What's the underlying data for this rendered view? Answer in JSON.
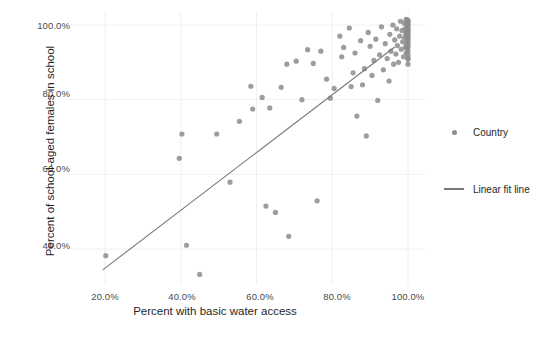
{
  "chart_data": {
    "type": "scatter",
    "title": "",
    "xlabel": "Percent with basic water access",
    "ylabel": "Percent of school-aged females in school",
    "xlim": [
      15.0,
      104.0
    ],
    "ylim": [
      30.0,
      104.0
    ],
    "xticks": [
      "20.0%",
      "40.0%",
      "60.0%",
      "80.0%",
      "100.0%"
    ],
    "xtick_values": [
      20,
      40,
      60,
      80,
      100
    ],
    "yticks": [
      "40.0%",
      "60.0%",
      "80.0%",
      "100.0%"
    ],
    "ytick_values": [
      40,
      60,
      80,
      100
    ],
    "grid": true,
    "legend_position": "right",
    "series": [
      {
        "name": "Country",
        "type": "scatter",
        "color": "#8c8c8c",
        "marker": "circle",
        "points": [
          [
            20.2,
            38.2
          ],
          [
            39.6,
            64.3
          ],
          [
            40.3,
            70.8
          ],
          [
            41.5,
            41.0
          ],
          [
            45.0,
            33.2
          ],
          [
            49.5,
            70.8
          ],
          [
            53.0,
            57.9
          ],
          [
            55.5,
            74.2
          ],
          [
            58.5,
            83.6
          ],
          [
            59.0,
            77.5
          ],
          [
            61.5,
            80.6
          ],
          [
            62.5,
            51.5
          ],
          [
            63.5,
            77.8
          ],
          [
            65.0,
            49.8
          ],
          [
            66.5,
            83.3
          ],
          [
            68.0,
            89.5
          ],
          [
            68.5,
            43.4
          ],
          [
            70.5,
            90.3
          ],
          [
            72.0,
            80.0
          ],
          [
            73.5,
            93.4
          ],
          [
            75.0,
            89.7
          ],
          [
            76.0,
            52.9
          ],
          [
            77.0,
            93.0
          ],
          [
            78.5,
            85.5
          ],
          [
            79.5,
            80.4
          ],
          [
            80.5,
            83.0
          ],
          [
            82.0,
            97.0
          ],
          [
            82.5,
            91.5
          ],
          [
            83.0,
            94.0
          ],
          [
            84.5,
            99.2
          ],
          [
            85.0,
            83.5
          ],
          [
            85.5,
            87.2
          ],
          [
            86.0,
            92.5
          ],
          [
            86.5,
            75.6
          ],
          [
            87.5,
            95.8
          ],
          [
            88.0,
            84.0
          ],
          [
            88.5,
            88.3
          ],
          [
            89.0,
            70.3
          ],
          [
            89.5,
            98.0
          ],
          [
            90.0,
            94.3
          ],
          [
            90.5,
            86.5
          ],
          [
            91.0,
            90.5
          ],
          [
            91.5,
            96.2
          ],
          [
            92.0,
            79.8
          ],
          [
            92.5,
            92.0
          ],
          [
            93.0,
            99.5
          ],
          [
            93.5,
            88.0
          ],
          [
            94.0,
            95.0
          ],
          [
            94.5,
            91.0
          ],
          [
            95.0,
            85.0
          ],
          [
            95.2,
            97.5
          ],
          [
            95.5,
            93.0
          ],
          [
            96.0,
            100.0
          ],
          [
            96.2,
            89.5
          ],
          [
            96.5,
            96.0
          ],
          [
            96.8,
            92.2
          ],
          [
            97.0,
            99.0
          ],
          [
            97.2,
            94.5
          ],
          [
            97.5,
            90.0
          ],
          [
            97.8,
            97.0
          ],
          [
            98.0,
            101.0
          ],
          [
            98.2,
            93.5
          ],
          [
            98.4,
            98.5
          ],
          [
            98.6,
            95.5
          ],
          [
            98.8,
            91.5
          ],
          [
            99.0,
            100.5
          ],
          [
            99.1,
            96.5
          ],
          [
            99.2,
            99.0
          ],
          [
            99.3,
            94.0
          ],
          [
            99.4,
            97.5
          ],
          [
            99.5,
            101.5
          ],
          [
            99.5,
            92.5
          ],
          [
            99.6,
            98.0
          ],
          [
            99.6,
            95.0
          ],
          [
            99.7,
            100.0
          ],
          [
            99.7,
            96.8
          ],
          [
            99.8,
            99.5
          ],
          [
            99.8,
            93.8
          ],
          [
            99.9,
            101.0
          ],
          [
            99.9,
            97.2
          ],
          [
            100.0,
            100.8
          ],
          [
            100.0,
            98.8
          ],
          [
            100.0,
            96.0
          ],
          [
            100.0,
            94.2
          ],
          [
            100.0,
            99.8
          ],
          [
            100.0,
            92.0
          ],
          [
            100.0,
            97.8
          ],
          [
            100.0,
            95.5
          ],
          [
            100.0,
            101.3
          ],
          [
            100.0,
            93.0
          ],
          [
            100.0,
            98.2
          ],
          [
            100.0,
            90.8
          ],
          [
            100.0,
            96.5
          ],
          [
            100.0,
            100.3
          ],
          [
            100.0,
            89.5
          ],
          [
            100.0,
            94.8
          ],
          [
            100.0,
            99.2
          ],
          [
            100.0,
            91.2
          ],
          [
            100.0,
            97.0
          ]
        ]
      },
      {
        "name": "Linear fit line",
        "type": "line",
        "color": "#7a7a7a",
        "x": [
          19.4,
          96.5
        ],
        "y": [
          34.4,
          94.1
        ]
      }
    ]
  },
  "legend": {
    "items": [
      {
        "label": "Country",
        "marker": "dot",
        "color": "#8c8c8c"
      },
      {
        "label": "Linear fit line",
        "marker": "line",
        "color": "#7a7a7a"
      }
    ]
  },
  "axes": {
    "x_title": "Percent with basic water access",
    "y_title": "Percent of school-aged females in school",
    "x_tick_labels": [
      "20.0%",
      "40.0%",
      "60.0%",
      "80.0%",
      "100.0%"
    ],
    "y_tick_labels": [
      "100.0%",
      "80.0%",
      "60.0%",
      "40.0%"
    ]
  },
  "colors": {
    "point": "#8c8c8c",
    "fit_line": "#7a7a7a",
    "grid": "#f0f0f0",
    "text": "#4a4a4a",
    "background": "#ffffff"
  }
}
